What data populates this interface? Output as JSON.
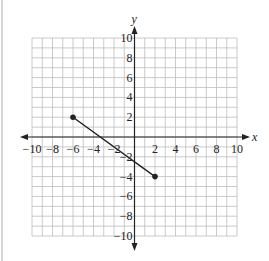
{
  "chart_data": {
    "type": "line",
    "title": "",
    "xlabel": "x",
    "ylabel": "y",
    "xlim": [
      -10,
      10
    ],
    "ylim": [
      -10,
      10
    ],
    "grid": true,
    "grid_step": 1,
    "x_ticks": [
      -10,
      -8,
      -6,
      -4,
      -2,
      2,
      4,
      6,
      8,
      10
    ],
    "y_ticks": [
      -10,
      -8,
      -6,
      -4,
      -2,
      2,
      4,
      6,
      8,
      10
    ],
    "x_tick_labels": [
      "−10",
      "−8",
      "−6",
      "−4",
      "−2",
      "2",
      "4",
      "6",
      "8",
      "10"
    ],
    "y_tick_labels": [
      "−10",
      "−8",
      "−6",
      "−4",
      "−2",
      "2",
      "4",
      "6",
      "8",
      "10"
    ],
    "series": [
      {
        "name": "segment",
        "points": [
          {
            "x": -6,
            "y": 2
          },
          {
            "x": 2,
            "y": -4
          }
        ],
        "endpoints_marked": true
      }
    ],
    "legend": null
  },
  "colors": {
    "grid": "#bdbdbd",
    "axis": "#222222",
    "segment": "#222222"
  }
}
